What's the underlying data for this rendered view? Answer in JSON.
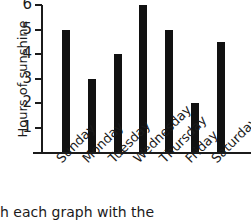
{
  "chart_data": {
    "type": "bar",
    "title": "",
    "xlabel": "",
    "ylabel": "Hours of sunshine",
    "categories": [
      "Sunday",
      "Monday",
      "Tuesday",
      "Wednesday",
      "Thursday",
      "Friday",
      "Saturday"
    ],
    "values": [
      5,
      3,
      4,
      6,
      5,
      2,
      4.5
    ],
    "ylim": [
      0,
      6
    ],
    "yticks": [
      1,
      2,
      3,
      4,
      5,
      6
    ],
    "ytick_labels": [
      "1",
      "2",
      "3",
      "4",
      "5",
      "6"
    ],
    "grid": false,
    "legend": false,
    "bar_color": "#111111",
    "axis_color": "#1b1b1b",
    "background_color": "#ffffff"
  },
  "caption": {
    "text": "h each graph with the"
  }
}
